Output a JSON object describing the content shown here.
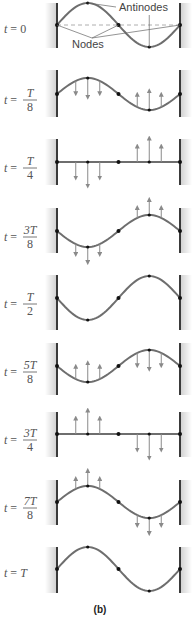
{
  "caption": "(b)",
  "annotations": {
    "antinodes": "Antinodes",
    "nodes": "Nodes"
  },
  "colors": {
    "string": "#6e6e6e",
    "rod": "#3a3a3a",
    "arrow": "#8a8a8a",
    "shade": "#d9d9d9",
    "dashed": "#9a9a9a",
    "node": "#111111",
    "text": "#555555"
  },
  "geometry": {
    "left_rod_x": 57,
    "right_rod_x": 180,
    "max_amplitude": 22
  },
  "panels": [
    {
      "label": "t = 0",
      "num": "",
      "den": "",
      "prefix": "t = ",
      "simple": "0",
      "baseline": 25,
      "rod_top": 3,
      "rod_bot": 48,
      "amp": 22,
      "arrows": "none",
      "dashed": true
    },
    {
      "label": "t = T/8",
      "num": "T",
      "den": "8",
      "prefix": "t = ",
      "simple": "",
      "baseline": 94,
      "rod_top": 70,
      "rod_bot": 117,
      "amp": 16,
      "arrows": "toward"
    },
    {
      "label": "t = T/4",
      "num": "T",
      "den": "4",
      "prefix": "t = ",
      "simple": "",
      "baseline": 162,
      "rod_top": 139,
      "rod_bot": 185,
      "amp": 0,
      "arrows": "flat-down-up"
    },
    {
      "label": "t = 3T/8",
      "num": "3T",
      "den": "8",
      "prefix": "t = ",
      "simple": "",
      "baseline": 231,
      "rod_top": 208,
      "rod_bot": 253,
      "amp": -16,
      "arrows": "away"
    },
    {
      "label": "t = T/2",
      "num": "T",
      "den": "2",
      "prefix": "t = ",
      "simple": "",
      "baseline": 298,
      "rod_top": 275,
      "rod_bot": 330,
      "amp": -22,
      "arrows": "none"
    },
    {
      "label": "t = 5T/8",
      "num": "5T",
      "den": "8",
      "prefix": "t = ",
      "simple": "",
      "baseline": 366,
      "rod_top": 343,
      "rod_bot": 395,
      "amp": -16,
      "arrows": "toward"
    },
    {
      "label": "t = 3T/4",
      "num": "3T",
      "den": "4",
      "prefix": "t = ",
      "simple": "",
      "baseline": 434,
      "rod_top": 412,
      "rod_bot": 457,
      "amp": 0,
      "arrows": "flat-up-down"
    },
    {
      "label": "t = 7T/8",
      "num": "7T",
      "den": "8",
      "prefix": "t = ",
      "simple": "",
      "baseline": 502,
      "rod_top": 480,
      "rod_bot": 525,
      "amp": 16,
      "arrows": "away"
    },
    {
      "label": "t = T",
      "num": "",
      "den": "",
      "prefix": "t = ",
      "simple": "T",
      "baseline": 569,
      "rod_top": 547,
      "rod_bot": 593,
      "amp": 22,
      "arrows": "none"
    }
  ]
}
